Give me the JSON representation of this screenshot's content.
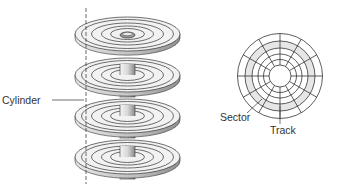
{
  "diagram": {
    "type": "hard-disk-geometry",
    "labels": {
      "cylinder": "Cylinder",
      "sector": "Sector",
      "track": "Track"
    },
    "platter_stack": {
      "platter_count": 4,
      "tracks_per_platter": 4
    },
    "disk_face": {
      "track_rings": 6,
      "sector_spokes": 12,
      "highlighted_track_color": "#e6e6e6"
    },
    "colors": {
      "line": "#333333",
      "platter_fill": "#f2f2f2",
      "platter_edge": "#bdbdbd",
      "spindle": "#cfcfcf"
    }
  }
}
